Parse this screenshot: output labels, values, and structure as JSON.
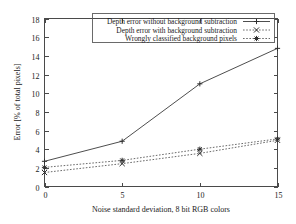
{
  "chart_data": {
    "type": "line",
    "title": "",
    "xlabel": "Noise standard deviation, 8 bit RGB colors",
    "ylabel": "Error [% of total pixels]",
    "x": [
      0,
      5,
      10,
      15
    ],
    "xticks": [
      "0",
      "5",
      "10",
      "15"
    ],
    "yticks": [
      "0",
      "2",
      "4",
      "6",
      "8",
      "10",
      "12",
      "14",
      "16",
      "18"
    ],
    "xlim": [
      0,
      15
    ],
    "ylim": [
      0,
      18
    ],
    "grid": false,
    "legend_position": "top-right-inside",
    "series": [
      {
        "name": "Depth error without background subtraction",
        "values": [
          2.7,
          4.85,
          11.0,
          14.8
        ],
        "marker": "plus",
        "line": "solid",
        "color": "#4e4e4e"
      },
      {
        "name": "Depth error with background subtraction",
        "values": [
          1.5,
          2.45,
          3.55,
          4.95
        ],
        "marker": "cross",
        "line": "dotted",
        "color": "#6a6a6a"
      },
      {
        "name": "Wrongly classified background pixels",
        "values": [
          2.05,
          2.8,
          4.0,
          5.1
        ],
        "marker": "asterisk",
        "line": "dotted",
        "color": "#6a6a6a"
      }
    ]
  },
  "legend": {
    "entries": [
      "Depth error without background subtraction",
      "Depth error with background subtraction",
      "Wrongly classified background pixels"
    ]
  },
  "axes": {
    "x_title": "Noise standard deviation, 8 bit RGB colors",
    "y_title": "Error [% of total pixels]",
    "x_tick_labels": [
      "0",
      "5",
      "10",
      "15"
    ],
    "y_tick_labels": [
      "0",
      "2",
      "4",
      "6",
      "8",
      "10",
      "12",
      "14",
      "16",
      "18"
    ]
  }
}
